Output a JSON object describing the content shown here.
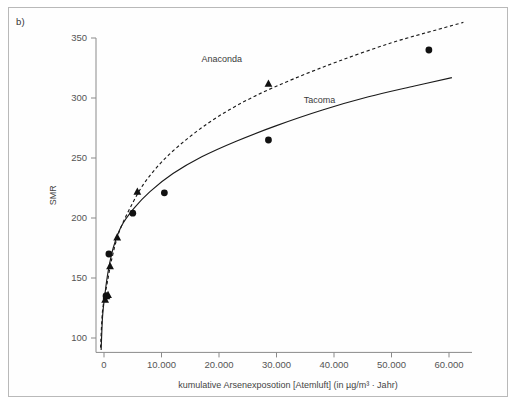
{
  "figure": {
    "panel_label": "b)"
  },
  "chart_data": {
    "type": "scatter",
    "title": "",
    "xlabel": "kumulative Arsenexposotion [Atemluft] (in µg/m³ · Jahr)",
    "ylabel": "SMR",
    "xlim": [
      -2000,
      64000
    ],
    "ylim": [
      88,
      360
    ],
    "grid": false,
    "legend_position": "inline-annotations",
    "xticks": [
      0,
      10000,
      20000,
      30000,
      40000,
      50000,
      60000
    ],
    "xticklabels": [
      "0",
      "10.000",
      "20.000",
      "30.000",
      "40.000",
      "50.000",
      "60.000"
    ],
    "yticks": [
      100,
      150,
      200,
      250,
      300,
      350
    ],
    "yticklabels": [
      "100",
      "150",
      "200",
      "250",
      "300",
      "350"
    ],
    "annotations": [
      {
        "text": "Anaconda",
        "x": 20500,
        "y": 330
      },
      {
        "text": "Tacoma",
        "x": 37500,
        "y": 296
      }
    ],
    "series": [
      {
        "name": "Anaconda",
        "marker": "triangle",
        "line_style": "dashed",
        "points": [
          {
            "x": 200,
            "y": 132
          },
          {
            "x": 420,
            "y": 135
          },
          {
            "x": 700,
            "y": 136
          },
          {
            "x": 1050,
            "y": 160
          },
          {
            "x": 2300,
            "y": 184
          },
          {
            "x": 5800,
            "y": 222
          },
          {
            "x": 28600,
            "y": 312
          }
        ],
        "fit_curve": {
          "form": "logarithmic",
          "points": [
            {
              "x": -600,
              "y": 92
            },
            {
              "x": -300,
              "y": 120
            },
            {
              "x": 100,
              "y": 134
            },
            {
              "x": 600,
              "y": 147
            },
            {
              "x": 1400,
              "y": 167
            },
            {
              "x": 2600,
              "y": 188
            },
            {
              "x": 4500,
              "y": 208
            },
            {
              "x": 7000,
              "y": 229
            },
            {
              "x": 10500,
              "y": 249
            },
            {
              "x": 15000,
              "y": 268
            },
            {
              "x": 20000,
              "y": 285
            },
            {
              "x": 26000,
              "y": 301
            },
            {
              "x": 33000,
              "y": 316
            },
            {
              "x": 41000,
              "y": 331
            },
            {
              "x": 50000,
              "y": 346
            },
            {
              "x": 58000,
              "y": 357
            },
            {
              "x": 62500,
              "y": 363
            }
          ]
        }
      },
      {
        "name": "Tacoma",
        "marker": "circle",
        "line_style": "solid",
        "points": [
          {
            "x": 350,
            "y": 135
          },
          {
            "x": 850,
            "y": 170
          },
          {
            "x": 5000,
            "y": 204
          },
          {
            "x": 10500,
            "y": 221
          },
          {
            "x": 28600,
            "y": 265
          },
          {
            "x": 56500,
            "y": 340
          }
        ],
        "fit_curve": {
          "form": "logarithmic",
          "points": [
            {
              "x": -500,
              "y": 90
            },
            {
              "x": -250,
              "y": 118
            },
            {
              "x": 150,
              "y": 136
            },
            {
              "x": 700,
              "y": 155
            },
            {
              "x": 1600,
              "y": 175
            },
            {
              "x": 3000,
              "y": 193
            },
            {
              "x": 5200,
              "y": 208
            },
            {
              "x": 8000,
              "y": 222
            },
            {
              "x": 12000,
              "y": 237
            },
            {
              "x": 17000,
              "y": 251
            },
            {
              "x": 23000,
              "y": 264
            },
            {
              "x": 30000,
              "y": 277
            },
            {
              "x": 38000,
              "y": 290
            },
            {
              "x": 46000,
              "y": 301
            },
            {
              "x": 54000,
              "y": 310
            },
            {
              "x": 60500,
              "y": 317
            }
          ]
        }
      }
    ]
  }
}
